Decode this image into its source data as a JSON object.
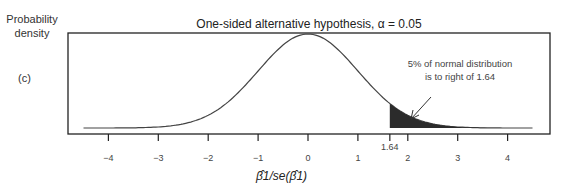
{
  "chart_data": {
    "type": "line",
    "title": "One-sided alternative hypothesis, α = 0.05",
    "ylabel": "Probability density",
    "xlabel": "β̂1/se(β̂1)",
    "panel_label": "(c)",
    "series": [
      {
        "name": "Standard normal density",
        "distribution": "normal",
        "mean": 0,
        "sd": 1
      }
    ],
    "x_range": [
      -4.5,
      4.5
    ],
    "xticks": [
      -4,
      -3,
      -2,
      -1,
      0,
      1,
      1.64,
      2,
      3,
      4
    ],
    "xtick_labels": [
      "−4",
      "−3",
      "−2",
      "−1",
      "0",
      "1",
      "1.64",
      "2",
      "3",
      "4"
    ],
    "shaded_region": {
      "from": 1.64,
      "to": 4.5,
      "color": "#333333"
    },
    "annotation": {
      "text_line1": "5% of normal distribution",
      "text_line2": "is to right of 1.64",
      "arrow_to_x": 1.95
    },
    "grid": false,
    "legend": "none"
  },
  "labels": {
    "ylabel_line1": "Probability",
    "ylabel_line2": "density",
    "panel": "(c)",
    "title": "One-sided alternative hypothesis, α = 0.05",
    "ann1": "5% of normal distribution",
    "ann2": "is to right of 1.64",
    "xlabel": "β̂1/se(β̂1)"
  }
}
